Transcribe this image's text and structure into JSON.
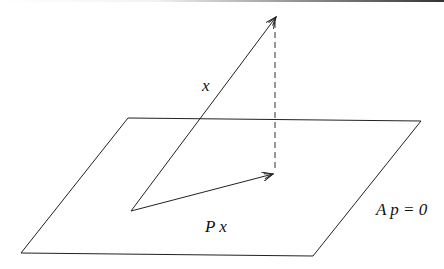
{
  "diagram": {
    "title": "",
    "plane": {
      "label": "A p = 0",
      "corners": [
        [
          128,
          118
        ],
        [
          421,
          121
        ],
        [
          313,
          256
        ],
        [
          21,
          253
        ]
      ],
      "stroke": "#222222"
    },
    "vectors": [
      {
        "name": "x",
        "label": "x",
        "from": [
          131,
          211
        ],
        "to": [
          276,
          17
        ],
        "style": "solid-arrow"
      },
      {
        "name": "Px",
        "label": "P x",
        "from": [
          131,
          211
        ],
        "to": [
          273,
          174
        ],
        "style": "solid-arrow"
      }
    ],
    "projection_line": {
      "from": [
        275,
        20
      ],
      "to": [
        275,
        172
      ],
      "style": "dashed"
    },
    "labels": {
      "x_label": "x",
      "px_label": "P x",
      "plane_label": "A p = 0"
    }
  }
}
